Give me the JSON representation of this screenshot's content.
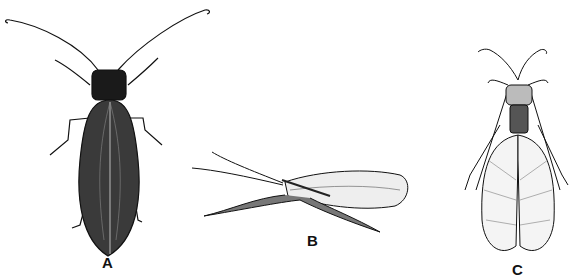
{
  "figure": {
    "panels": [
      {
        "id": "A",
        "label": "A",
        "subject": "stonefly-like insect, dorsal view, dark wings folded flat"
      },
      {
        "id": "B",
        "label": "B",
        "subject": "lacewing, lateral view, wings folded roof-like"
      },
      {
        "id": "C",
        "label": "C",
        "subject": "dobsonfly/fishfly, dorsal view, reticulate veined wings"
      }
    ]
  },
  "colors": {
    "background": "#ffffff",
    "ink": "#111111",
    "wing_dark": "#2a2a2a"
  }
}
